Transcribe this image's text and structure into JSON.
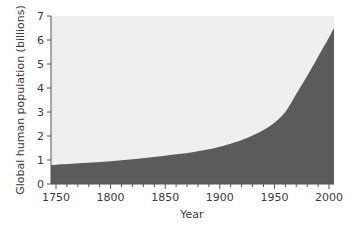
{
  "chart_data": {
    "type": "area",
    "title": "",
    "xlabel": "Year",
    "ylabel": "Global human population (billions)",
    "xlim": [
      1745,
      2005
    ],
    "ylim": [
      0,
      7
    ],
    "x_ticks": [
      1750,
      1800,
      1850,
      1900,
      1950,
      2000
    ],
    "x_tick_labels": [
      "1750",
      "1800",
      "1850",
      "1900",
      "1950",
      "2000"
    ],
    "y_ticks": [
      0,
      1,
      2,
      3,
      4,
      5,
      6,
      7
    ],
    "y_tick_labels": [
      "0",
      "1",
      "2",
      "3",
      "4",
      "5",
      "6",
      "7"
    ],
    "grid": false,
    "legend": null,
    "colors": {
      "fill": "#5b5b5b",
      "plot_background": "#efefef",
      "axis": "#555555"
    },
    "series": [
      {
        "name": "Global human population",
        "x": [
          1745,
          1750,
          1775,
          1800,
          1825,
          1850,
          1875,
          1900,
          1925,
          1940,
          1950,
          1960,
          1970,
          1980,
          1990,
          2000,
          2005
        ],
        "values": [
          0.79,
          0.8,
          0.87,
          0.95,
          1.05,
          1.18,
          1.32,
          1.55,
          1.92,
          2.25,
          2.55,
          3.0,
          3.75,
          4.5,
          5.3,
          6.1,
          6.5
        ]
      }
    ]
  }
}
